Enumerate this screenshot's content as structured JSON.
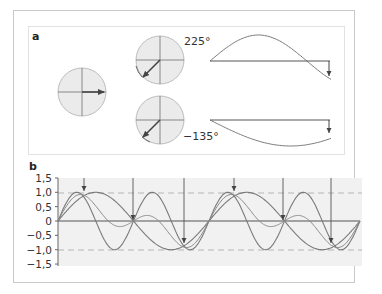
{
  "figure": {
    "panel_a": {
      "label": "a",
      "phasors": [
        {
          "name": "reference",
          "angle_deg": 0
        },
        {
          "name": "upper",
          "angle_deg": 225,
          "label": "225°"
        },
        {
          "name": "lower",
          "angle_deg": -135,
          "label": "−135°"
        }
      ]
    },
    "panel_b": {
      "label": "b",
      "y_ticks": [
        "1,5",
        "1,0",
        "0,5",
        "0",
        "−0,5",
        "−1,0",
        "−1,5"
      ]
    }
  },
  "colors": {
    "circle_fill": "#ebebeb",
    "circle_stroke": "#b9b9b9",
    "curve": "#7a7a7a",
    "arrow": "#444444",
    "plot_bg": "#f1f1f1",
    "dashed": "#b5b5b5"
  },
  "chart_data": {
    "type": "line",
    "title": "",
    "xlabel": "",
    "ylabel": "",
    "ylim": [
      -1.5,
      1.5
    ],
    "y_ticks": [
      1.5,
      1.0,
      0.5,
      0,
      -0.5,
      -1.0,
      -1.5
    ],
    "reference_lines": [
      1.0,
      -1.0
    ],
    "series": [
      {
        "name": "slow sine",
        "amplitude": 1.0,
        "cycles": 2
      },
      {
        "name": "fast sine",
        "amplitude": 1.0,
        "cycles": 4
      },
      {
        "name": "phase-shifted sine",
        "amplitude": 1.0,
        "cycles": 2
      }
    ],
    "arrows_at_fraction_of_x": [
      0.065,
      0.247,
      0.41,
      0.59,
      0.745,
      0.895
    ]
  }
}
